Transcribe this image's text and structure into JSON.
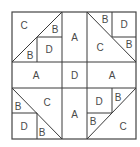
{
  "diagram": {
    "type": "quilt-block",
    "colors": {
      "line": "#3a3a3a",
      "text": "#4a4a4a",
      "background": "#ffffff"
    },
    "layout": {
      "columns": [
        "left-quadrant",
        "center-strip",
        "right-quadrant"
      ],
      "rows": [
        "top-quadrant",
        "center-strip",
        "bottom-quadrant"
      ]
    },
    "pieces": {
      "top_left": {
        "c": "C",
        "b_upper": "B",
        "d": "D",
        "b_lower": "B"
      },
      "top_center": {
        "a": "A"
      },
      "top_right": {
        "b_upper": "B",
        "d": "D",
        "c": "C",
        "b_lower": "B"
      },
      "middle_left": {
        "a": "A"
      },
      "middle_center": {
        "d": "D"
      },
      "middle_right": {
        "a": "A"
      },
      "bottom_left": {
        "b_upper": "B",
        "c": "C",
        "d": "D",
        "b_lower": "B"
      },
      "bottom_center": {
        "a": "A"
      },
      "bottom_right": {
        "d": "D",
        "b_upper": "B",
        "b_lower": "B",
        "c": "C"
      }
    }
  }
}
